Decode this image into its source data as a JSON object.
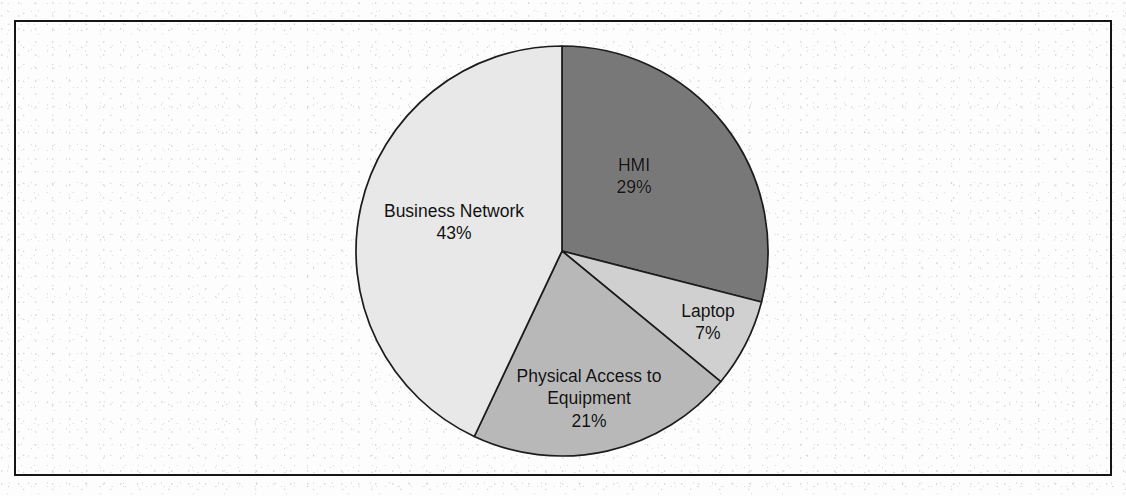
{
  "figure": {
    "clipped_top_text": "",
    "frame": {
      "border_color": "#151515"
    },
    "background_color": "#ffffff"
  },
  "chart_data": {
    "type": "pie",
    "title": "",
    "subtitle": "",
    "xlabel": "",
    "ylabel": "",
    "legend_position": "none",
    "labels_inside_slices": true,
    "start_angle_deg": 0,
    "direction": "clockwise",
    "categories": [
      "HMI",
      "Laptop",
      "Physical Access to Equipment",
      "Business Network"
    ],
    "values": [
      29,
      7,
      21,
      43
    ],
    "value_suffix": "%",
    "colors": [
      "#787878",
      "#d0d0d0",
      "#b8b8b8",
      "#e8e8e8"
    ],
    "slices": [
      {
        "label": "HMI",
        "label_line1": "HMI",
        "label_line2": "",
        "value": 29,
        "value_text": "29%",
        "color": "#787878",
        "start_angle_deg": 0,
        "end_angle_deg": 104.4,
        "label_x": 634,
        "label_y": 176
      },
      {
        "label": "Laptop",
        "label_line1": "Laptop",
        "label_line2": "",
        "value": 7,
        "value_text": "7%",
        "color": "#d0d0d0",
        "start_angle_deg": 104.4,
        "end_angle_deg": 129.6,
        "label_x": 708,
        "label_y": 322
      },
      {
        "label": "Physical Access to Equipment",
        "label_line1": "Physical Access to",
        "label_line2": "Equipment",
        "value": 21,
        "value_text": "21%",
        "color": "#b8b8b8",
        "start_angle_deg": 129.6,
        "end_angle_deg": 205.2,
        "label_x": 589,
        "label_y": 399
      },
      {
        "label": "Business Network",
        "label_line1": "Business Network",
        "label_line2": "",
        "value": 43,
        "value_text": "43%",
        "color": "#e8e8e8",
        "start_angle_deg": 205.2,
        "end_angle_deg": 360,
        "label_x": 454,
        "label_y": 222
      }
    ],
    "geometry": {
      "center_x": 562,
      "center_y": 251,
      "radius_x": 206,
      "radius_y": 205
    }
  }
}
